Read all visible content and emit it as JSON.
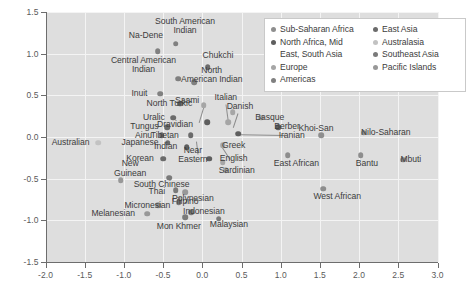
{
  "chart_data": {
    "type": "scatter",
    "title": "",
    "xlabel": "",
    "ylabel": "",
    "xlim": [
      -2.0,
      3.0
    ],
    "ylim": [
      -1.5,
      1.5
    ],
    "xticks": [
      "-2.0",
      "-1.5",
      "-1.0",
      "-0.5",
      "0.0",
      "0.5",
      "1.0",
      "1.5",
      "2.0",
      "2.5",
      "3.0"
    ],
    "yticks": [
      "1.5",
      "1.0",
      "0.5",
      "0.0",
      "-0.5",
      "-1.0",
      "-1.5"
    ],
    "grid": true,
    "legend_position": "top-right",
    "series": [
      {
        "name": "Sub-Saharan Africa",
        "color": "#8e8e8e"
      },
      {
        "name": "North Africa, Mid East, South Asia",
        "color": "#5e5e5e"
      },
      {
        "name": "Europe",
        "color": "#a6a6a6"
      },
      {
        "name": "Americas",
        "color": "#808080"
      },
      {
        "name": "East Asia",
        "color": "#6b6b6b"
      },
      {
        "name": "Australasia",
        "color": "#c2c2c2"
      },
      {
        "name": "Southeast Asia",
        "color": "#7a7a7a"
      },
      {
        "name": "Pacific Islands",
        "color": "#989898"
      }
    ],
    "points": [
      {
        "label": "Na-Dene",
        "x": -0.57,
        "y": 1.03,
        "color": "#808080",
        "lx": -0.72,
        "ly": 1.22,
        "align": "c"
      },
      {
        "label": "South American\nIndian",
        "x": -0.34,
        "y": 1.12,
        "color": "#808080",
        "lx": -0.22,
        "ly": 1.33,
        "align": "c"
      },
      {
        "label": "Central American\nIndian",
        "x": -0.31,
        "y": 0.7,
        "color": "#808080",
        "lx": -0.75,
        "ly": 0.86,
        "align": "c"
      },
      {
        "label": "Chukchi",
        "x": 0.07,
        "y": 0.84,
        "color": "#6b6b6b",
        "lx": 0.2,
        "ly": 0.98,
        "align": "c"
      },
      {
        "label": "North\nAmerican Indian",
        "x": -0.1,
        "y": 0.66,
        "color": "#808080",
        "lx": 0.12,
        "ly": 0.74,
        "align": "c"
      },
      {
        "label": "Inuit",
        "x": -0.54,
        "y": 0.52,
        "color": "#808080",
        "lx": -0.7,
        "ly": 0.52,
        "align": "r"
      },
      {
        "label": "North Turkic",
        "x": -0.28,
        "y": 0.4,
        "color": "#6b6b6b",
        "lx": -0.42,
        "ly": 0.4,
        "align": "c"
      },
      {
        "label": "Saami",
        "x": 0.02,
        "y": 0.38,
        "color": "#a6a6a6",
        "lx": -0.04,
        "ly": 0.44,
        "align": "r"
      },
      {
        "label": "Italian",
        "x": 0.33,
        "y": 0.18,
        "color": "#a6a6a6",
        "lx": 0.3,
        "ly": 0.47,
        "align": "c"
      },
      {
        "label": "Danish",
        "x": 0.39,
        "y": 0.3,
        "color": "#a6a6a6",
        "lx": 0.48,
        "ly": 0.36,
        "align": "c"
      },
      {
        "label": "Uralic",
        "x": -0.37,
        "y": 0.23,
        "color": "#6b6b6b",
        "lx": -0.48,
        "ly": 0.23,
        "align": "r"
      },
      {
        "label": "Tungus",
        "x": -0.45,
        "y": 0.12,
        "color": "#6b6b6b",
        "lx": -0.56,
        "ly": 0.12,
        "align": "r"
      },
      {
        "label": "Dravidian",
        "x": 0.06,
        "y": 0.18,
        "color": "#5e5e5e",
        "lx": -0.12,
        "ly": 0.15,
        "align": "r"
      },
      {
        "label": "Basque",
        "x": 0.75,
        "y": 0.23,
        "color": "#a6a6a6",
        "lx": 0.86,
        "ly": 0.23,
        "align": "c"
      },
      {
        "label": "Ainu",
        "x": -0.52,
        "y": 0.02,
        "color": "#6b6b6b",
        "lx": -0.64,
        "ly": 0.02,
        "align": "r"
      },
      {
        "label": "Tibetan",
        "x": -0.15,
        "y": 0.02,
        "color": "#6b6b6b",
        "lx": -0.3,
        "ly": 0.02,
        "align": "r"
      },
      {
        "label": "Berber",
        "x": 0.97,
        "y": 0.12,
        "color": "#5e5e5e",
        "lx": 1.08,
        "ly": 0.12,
        "align": "c"
      },
      {
        "label": "Iranian",
        "x": 0.46,
        "y": 0.04,
        "color": "#5e5e5e",
        "lx": 1.14,
        "ly": 0.02,
        "align": "c"
      },
      {
        "label": "Khoi-San",
        "x": 1.52,
        "y": 0.02,
        "color": "#8e8e8e",
        "lx": 1.45,
        "ly": 0.1,
        "align": "c"
      },
      {
        "label": "Nilo-Saharan",
        "x": 2.06,
        "y": 0.05,
        "color": "#8e8e8e",
        "lx": 2.34,
        "ly": 0.05,
        "align": "c"
      },
      {
        "label": "Japanese",
        "x": -0.44,
        "y": -0.07,
        "color": "#6b6b6b",
        "lx": -0.56,
        "ly": -0.07,
        "align": "r"
      },
      {
        "label": "Australian",
        "x": -1.33,
        "y": -0.07,
        "color": "#c2c2c2",
        "lx": -1.44,
        "ly": -0.07,
        "align": "r"
      },
      {
        "label": "Greek",
        "x": 0.26,
        "y": -0.1,
        "color": "#a6a6a6",
        "lx": 0.4,
        "ly": -0.1,
        "align": "c"
      },
      {
        "label": "Indian",
        "x": -0.2,
        "y": -0.12,
        "color": "#5e5e5e",
        "lx": -0.32,
        "ly": -0.12,
        "align": "r"
      },
      {
        "label": "Korean",
        "x": -0.5,
        "y": -0.26,
        "color": "#6b6b6b",
        "lx": -0.62,
        "ly": -0.26,
        "align": "r"
      },
      {
        "label": "Near\nEastern",
        "x": 0.09,
        "y": -0.26,
        "color": "#5e5e5e",
        "lx": -0.12,
        "ly": -0.22,
        "align": "c"
      },
      {
        "label": "English",
        "x": 0.26,
        "y": -0.3,
        "color": "#a6a6a6",
        "lx": 0.4,
        "ly": -0.26,
        "align": "c"
      },
      {
        "label": "Sardinian",
        "x": 0.3,
        "y": -0.4,
        "color": "#a6a6a6",
        "lx": 0.44,
        "ly": -0.4,
        "align": "c"
      },
      {
        "label": "East African",
        "x": 1.09,
        "y": -0.22,
        "color": "#8e8e8e",
        "lx": 1.2,
        "ly": -0.32,
        "align": "c"
      },
      {
        "label": "Bantu",
        "x": 2.02,
        "y": -0.22,
        "color": "#8e8e8e",
        "lx": 2.1,
        "ly": -0.32,
        "align": "c"
      },
      {
        "label": "Mbuti",
        "x": 2.56,
        "y": -0.27,
        "color": "#8e8e8e",
        "lx": 2.66,
        "ly": -0.27,
        "align": "c"
      },
      {
        "label": "New\nGuinean",
        "x": -1.04,
        "y": -0.52,
        "color": "#989898",
        "lx": -0.92,
        "ly": -0.38,
        "align": "c"
      },
      {
        "label": "South Chinese",
        "x": -0.42,
        "y": -0.49,
        "color": "#7a7a7a",
        "lx": -0.52,
        "ly": -0.57,
        "align": "c"
      },
      {
        "label": "Thai",
        "x": -0.34,
        "y": -0.64,
        "color": "#7a7a7a",
        "lx": -0.58,
        "ly": -0.66,
        "align": "c"
      },
      {
        "label": "West African",
        "x": 1.54,
        "y": -0.62,
        "color": "#8e8e8e",
        "lx": 1.72,
        "ly": -0.72,
        "align": "c"
      },
      {
        "label": "Polynesian",
        "x": -0.22,
        "y": -0.66,
        "color": "#989898",
        "lx": -0.12,
        "ly": -0.74,
        "align": "c"
      },
      {
        "label": "Micronesian",
        "x": -0.56,
        "y": -0.82,
        "color": "#989898",
        "lx": -0.7,
        "ly": -0.82,
        "align": "c"
      },
      {
        "label": "Filipino",
        "x": -0.3,
        "y": -0.78,
        "color": "#7a7a7a",
        "lx": -0.22,
        "ly": -0.78,
        "align": "c"
      },
      {
        "label": "Melanesian",
        "x": -0.7,
        "y": -0.92,
        "color": "#989898",
        "lx": -0.86,
        "ly": -0.92,
        "align": "r"
      },
      {
        "label": "Indonesian",
        "x": -0.14,
        "y": -0.9,
        "color": "#7a7a7a",
        "lx": 0.02,
        "ly": -0.9,
        "align": "c"
      },
      {
        "label": "Mon Khmer",
        "x": -0.22,
        "y": -0.96,
        "color": "#7a7a7a",
        "lx": -0.3,
        "ly": -1.08,
        "align": "c"
      },
      {
        "label": "Malaysian",
        "x": 0.21,
        "y": -0.98,
        "color": "#7a7a7a",
        "lx": 0.34,
        "ly": -1.05,
        "align": "c"
      }
    ],
    "leaders": [
      {
        "from_x": 0.3,
        "from_y": 0.4,
        "to_x": 0.33,
        "to_y": 0.19
      },
      {
        "from_x": 0.46,
        "from_y": 0.29,
        "to_x": 0.4,
        "to_y": 0.12
      },
      {
        "from_x": 0.02,
        "from_y": 0.37,
        "to_x": -0.04,
        "to_y": 0.18
      },
      {
        "from_x": 1.06,
        "from_y": 0.03,
        "to_x": 0.49,
        "to_y": 0.04
      },
      {
        "from_x": -0.06,
        "from_y": -0.2,
        "to_x": -0.08,
        "to_y": -0.04
      },
      {
        "from_x": 0.35,
        "from_y": -0.26,
        "to_x": 0.24,
        "to_y": -0.1
      }
    ]
  },
  "legend": {
    "columns": [
      {
        "items": [
          {
            "label": "Sub-Saharan Africa",
            "color": "#8e8e8e"
          },
          {
            "label": "North Africa, Mid",
            "color": "#5e5e5e"
          },
          {
            "label": "East, South Asia",
            "color": null
          },
          {
            "label": "Europe",
            "color": "#a6a6a6"
          },
          {
            "label": "Americas",
            "color": "#808080"
          }
        ]
      },
      {
        "items": [
          {
            "label": "East Asia",
            "color": "#6b6b6b"
          },
          {
            "label": "Australasia",
            "color": "#c2c2c2"
          },
          {
            "label": "Southeast Asia",
            "color": "#7a7a7a"
          },
          {
            "label": "Pacific Islands",
            "color": "#989898"
          }
        ]
      }
    ]
  }
}
